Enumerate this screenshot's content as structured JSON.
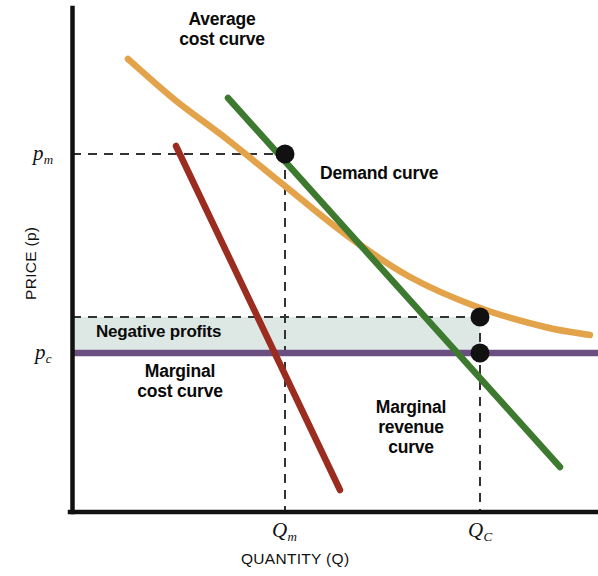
{
  "figure": {
    "domain": "chart",
    "background": "#ffffff"
  },
  "axes": {
    "x_title": "QUANTITY (Q)",
    "y_title": "PRICE (p)",
    "axis_color": "#111111",
    "x_ticks": [
      {
        "id": "Qm",
        "base": "Q",
        "sub": "m",
        "x": 285
      },
      {
        "id": "QC",
        "base": "Q",
        "sub": "C",
        "x": 480
      }
    ],
    "y_ticks": [
      {
        "id": "pm",
        "base": "p",
        "sub": "m",
        "y": 154
      },
      {
        "id": "pc",
        "base": "p",
        "sub": "c",
        "y": 353
      }
    ]
  },
  "annotations": {
    "average_cost": "Average\ncost curve",
    "demand": "Demand curve",
    "marginal_revenue": "Marginal\nrevenue\ncurve",
    "marginal_cost": "Marginal\ncost curve",
    "negative_profits": "Negative profits"
  },
  "colors": {
    "average_cost": "#e3a34a",
    "demand": "#3d7a30",
    "marginal_revenue": "#9b2d20",
    "marginal_cost": "#6b4f82",
    "negative_profits_fill": "#dde8e4",
    "axis": "#111111",
    "dashed_guide": "#333333",
    "point": "#111111",
    "label_text": "#0a0a0a"
  },
  "chart_data": {
    "type": "line",
    "title": "",
    "xlabel": "QUANTITY (Q)",
    "ylabel": "PRICE (p)",
    "grid": false,
    "legend": "inline-annotations",
    "xlim": [
      0,
      598
    ],
    "ylim": [
      0,
      512
    ],
    "note": "Natural monopoly: average cost curve declining, regulated price at marginal cost produces negative profits.",
    "series": [
      {
        "name": "Average cost curve",
        "color": "#e3a34a",
        "style": "convex-decreasing",
        "points": [
          [
            128,
            59
          ],
          [
            175,
            100
          ],
          [
            228,
            140
          ],
          [
            285,
            186
          ],
          [
            345,
            234
          ],
          [
            410,
            277
          ],
          [
            480,
            308
          ],
          [
            545,
            327
          ],
          [
            590,
            335
          ]
        ]
      },
      {
        "name": "Demand curve",
        "color": "#3d7a30",
        "style": "straight-decreasing",
        "points": [
          [
            228,
            98
          ],
          [
            560,
            467
          ]
        ]
      },
      {
        "name": "Marginal revenue curve",
        "color": "#9b2d20",
        "style": "straight-decreasing",
        "points": [
          [
            176,
            146
          ],
          [
            340,
            490
          ]
        ]
      },
      {
        "name": "Marginal cost curve",
        "color": "#6b4f82",
        "style": "horizontal",
        "points": [
          [
            72,
            353
          ],
          [
            598,
            353
          ]
        ]
      }
    ],
    "points_of_interest": [
      {
        "name": "monopoly-outcome",
        "x": 285,
        "y": 154,
        "label": "(Q_m, p_m)"
      },
      {
        "name": "competitive-price-on-demand",
        "x": 480,
        "y": 353,
        "label": "(Q_C, p_c)"
      },
      {
        "name": "average-cost-at-QC",
        "x": 480,
        "y": 317,
        "label": "(Q_C, AC)"
      }
    ],
    "shaded_regions": [
      {
        "name": "Negative profits",
        "fill": "#dde8e4",
        "x_range": [
          72,
          480
        ],
        "y_range": [
          317,
          353
        ]
      }
    ],
    "guides": [
      {
        "name": "pm-horizontal",
        "orientation": "horizontal",
        "y": 154,
        "x_range": [
          72,
          285
        ]
      },
      {
        "name": "ac-at-QC-horizontal",
        "orientation": "horizontal",
        "y": 317,
        "x_range": [
          72,
          480
        ]
      },
      {
        "name": "Qm-vertical",
        "orientation": "vertical",
        "x": 285,
        "y_range": [
          154,
          512
        ]
      },
      {
        "name": "QC-vertical",
        "orientation": "vertical",
        "x": 480,
        "y_range": [
          317,
          512
        ]
      }
    ]
  }
}
